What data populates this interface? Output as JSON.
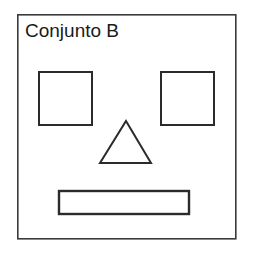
{
  "figure": {
    "title": "Conjunto B",
    "background_color": "#ffffff",
    "stroke_color": "#3a3a3a",
    "shape_stroke_color": "#2b2b2b",
    "fill_color": "#ffffff",
    "container": {
      "name": "set-border",
      "shape": "rectangle",
      "x": 17,
      "y": 14,
      "width": 219,
      "height": 225,
      "stroke_width": 1.6
    },
    "shapes": [
      {
        "name": "square-left",
        "shape": "square",
        "x": 38,
        "y": 71,
        "width": 54,
        "height": 54,
        "stroke_width": 2
      },
      {
        "name": "square-right",
        "shape": "square",
        "x": 160,
        "y": 71,
        "width": 54,
        "height": 54,
        "stroke_width": 2
      },
      {
        "name": "triangle-center",
        "shape": "triangle",
        "apex_x": 126,
        "apex_y": 121,
        "base_left_x": 100,
        "base_right_x": 151,
        "base_y": 163,
        "stroke_width": 2
      },
      {
        "name": "rectangle-bottom",
        "shape": "rectangle",
        "x": 58,
        "y": 190,
        "width": 132,
        "height": 25,
        "stroke_width": 2.4
      }
    ]
  }
}
